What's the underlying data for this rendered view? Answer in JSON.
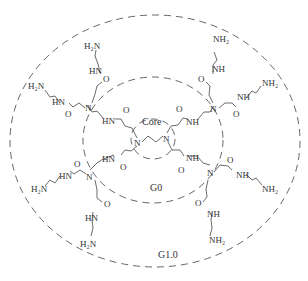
{
  "diagram": {
    "regions": [
      {
        "id": "core",
        "label": "Core"
      },
      {
        "id": "g0",
        "label": "G0"
      },
      {
        "id": "g1",
        "label": "G1.0"
      }
    ],
    "groups": {
      "amine": "H₂N",
      "amine_r": "NH₂",
      "amide_l": "HN",
      "amide_r": "NH",
      "carbonyl": "O",
      "nitrogen": "N"
    }
  }
}
